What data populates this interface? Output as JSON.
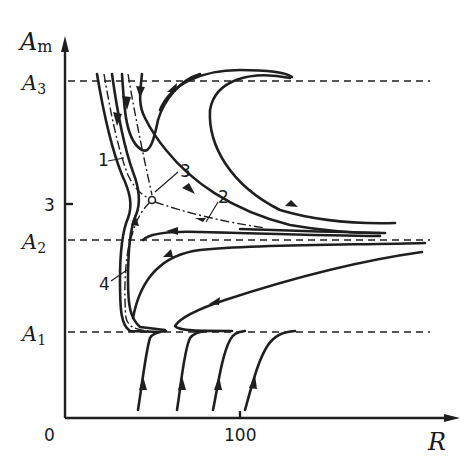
{
  "figure": {
    "type": "phase-plane trajectory diagram",
    "y_axis": {
      "label": "A",
      "label_subscript": "m",
      "ticks": [
        {
          "label": "3",
          "y": 204
        }
      ]
    },
    "x_axis": {
      "label": "R",
      "origin_label": "0",
      "ticks": [
        {
          "label": "100",
          "x": 240
        }
      ]
    },
    "levels": [
      {
        "id": "A3",
        "label": "A",
        "subscript": "3",
        "y": 81
      },
      {
        "id": "A2",
        "label": "A",
        "subscript": "2",
        "y": 240
      },
      {
        "id": "A1",
        "label": "A",
        "subscript": "1",
        "y": 332
      }
    ],
    "curve_labels": [
      {
        "id": "1",
        "text": "1"
      },
      {
        "id": "2",
        "text": "2"
      },
      {
        "id": "3",
        "text": "3"
      },
      {
        "id": "4",
        "text": "4"
      }
    ],
    "colors": {
      "ink": "#1f1f1f",
      "background": "#ffffff"
    }
  }
}
